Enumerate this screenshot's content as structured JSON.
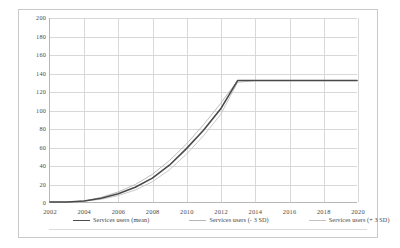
{
  "chart_data": {
    "type": "line",
    "title": "",
    "xlabel": "",
    "ylabel": "",
    "xlim": [
      2002,
      2020
    ],
    "ylim": [
      0,
      200
    ],
    "ytick_step": 20,
    "xtick_step": 2,
    "grid": true,
    "legend_position": "bottom",
    "xticks": [
      "2002",
      "2004",
      "2006",
      "2008",
      "2010",
      "2012",
      "2014",
      "2016",
      "2018",
      "2020"
    ],
    "yticks": [
      "0",
      "20",
      "40",
      "60",
      "80",
      "100",
      "120",
      "140",
      "160",
      "180",
      "200"
    ],
    "x": [
      2002,
      2003,
      2004,
      2005,
      2006,
      2007,
      2008,
      2009,
      2010,
      2011,
      2012,
      2013,
      2014,
      2015,
      2016,
      2017,
      2018,
      2019,
      2020
    ],
    "series": [
      {
        "name": "Services users (mean)",
        "color": "#4a4a4a",
        "width": 1.6,
        "values": [
          0,
          0,
          1,
          4,
          9,
          16,
          26,
          40,
          58,
          78,
          101,
          132,
          132,
          132,
          132,
          132,
          132,
          132,
          132
        ]
      },
      {
        "name": "Services users (- 3 SD)",
        "color": "#b5b5b5",
        "width": 0.9,
        "values": [
          0,
          0,
          1,
          5,
          11,
          19,
          30,
          45,
          63,
          84,
          107,
          132,
          132,
          132,
          132,
          132,
          132,
          132,
          132
        ]
      },
      {
        "name": "Services users (+ 3 SD)",
        "color": "#c2c2c2",
        "width": 0.9,
        "values": [
          0,
          0,
          1,
          3,
          7,
          13,
          22,
          35,
          52,
          72,
          95,
          130,
          132,
          132,
          132,
          132,
          132,
          132,
          132
        ]
      }
    ],
    "plateau_value": 132,
    "plateau_start_year": 2013
  },
  "legend": {
    "items": [
      {
        "label": "Services users (mean)",
        "color": "#4a4a4a",
        "thickness": "1.6px"
      },
      {
        "label": "Services users (- 3 SD)",
        "color": "#b5b5b5",
        "thickness": "1px"
      },
      {
        "label": "Services users (+ 3 SD)",
        "color": "#c2c2c2",
        "thickness": "1px"
      }
    ]
  },
  "colors": {
    "frame": "#c9c9c9",
    "grid": "#d8d8d8",
    "axis": "#b6b6b6",
    "text": "#4a4a4a",
    "background": "#ffffff"
  }
}
